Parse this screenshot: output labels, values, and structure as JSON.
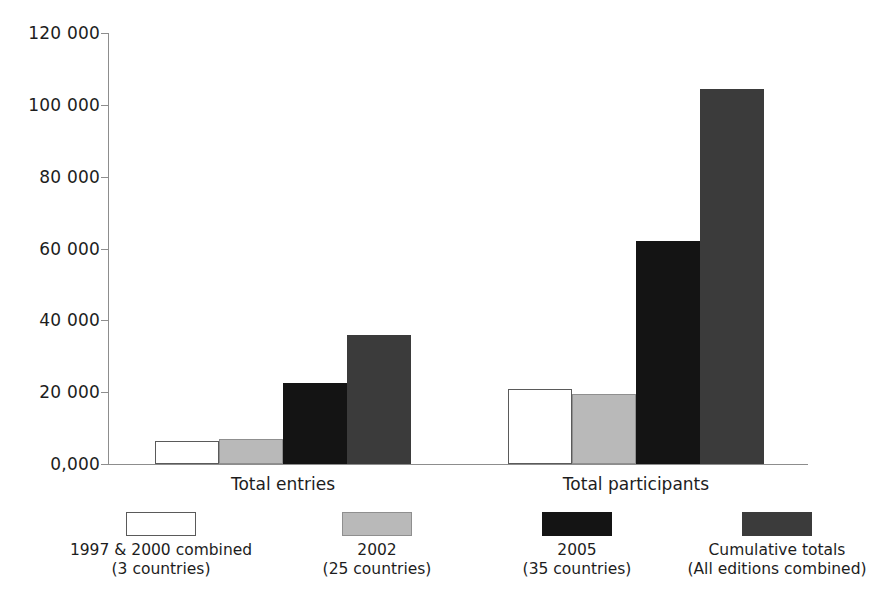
{
  "chart_data": {
    "type": "bar",
    "title": "",
    "subtitle": "",
    "xlabel": "",
    "ylabel": "",
    "categories": [
      "Total entries",
      "Total participants"
    ],
    "series": [
      {
        "name": "1997 & 2000 combined",
        "sublabel": "(3 countries)",
        "style": "white",
        "color": "#ffffff",
        "values": [
          6500,
          21000
        ]
      },
      {
        "name": "2002",
        "sublabel": "(25 countries)",
        "style": "light-gray",
        "color": "#b9b9b9",
        "values": [
          7000,
          19500
        ]
      },
      {
        "name": "2005",
        "sublabel": "(35 countries)",
        "style": "black",
        "color": "#141414",
        "values": [
          22500,
          62000
        ]
      },
      {
        "name": "Cumulative totals",
        "sublabel": "(All editions combined)",
        "style": "dark-gray",
        "color": "#3b3b3b",
        "values": [
          36000,
          104500
        ]
      }
    ],
    "ylim": [
      0,
      120000
    ],
    "ytick_values": [
      0,
      20000,
      40000,
      60000,
      80000,
      100000,
      120000
    ],
    "ytick_labels": [
      "0,000",
      "20 000",
      "40 000",
      "60 000",
      "80 000",
      "100 000",
      "120 000"
    ],
    "grid": false,
    "legend_position": "bottom"
  },
  "axis": {
    "ticks": [
      {
        "label": "120 000",
        "value": 120000
      },
      {
        "label": "100 000",
        "value": 100000
      },
      {
        "label": "80 000",
        "value": 80000
      },
      {
        "label": "60 000",
        "value": 60000
      },
      {
        "label": "40 000",
        "value": 40000
      },
      {
        "label": "20 000",
        "value": 20000
      },
      {
        "label": "0,000",
        "value": 0
      }
    ]
  },
  "groups": [
    {
      "label": "Total entries"
    },
    {
      "label": "Total participants"
    }
  ],
  "legend": [
    {
      "line1": "1997 & 2000 combined",
      "line2": "(3 countries)",
      "style": "white"
    },
    {
      "line1": "2002",
      "line2": "(25 countries)",
      "style": "light"
    },
    {
      "line1": "2005",
      "line2": "(35 countries)",
      "style": "black"
    },
    {
      "line1": "Cumulative totals",
      "line2": "(All editions combined)",
      "style": "dark"
    }
  ]
}
